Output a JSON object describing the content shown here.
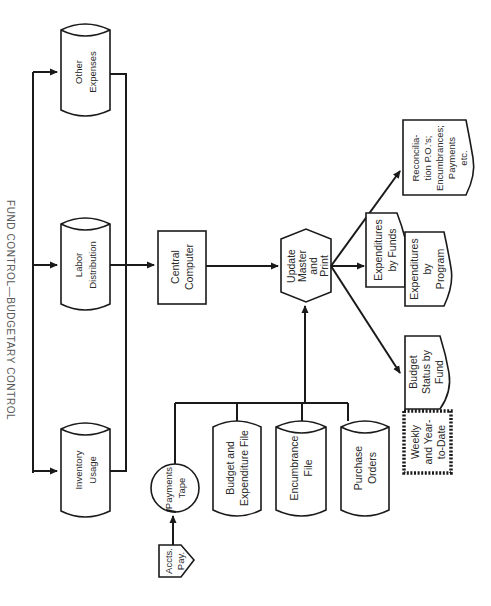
{
  "title": "FUND CONTROL—BUDGETARY CONTROL",
  "orientation": "rotated 90 degrees clockwise",
  "nodes": {
    "other_expenses": {
      "type": "disk-file",
      "lines": [
        "Other",
        "Expenses"
      ]
    },
    "labor_distribution": {
      "type": "disk-file",
      "lines": [
        "Labor",
        "Distribution"
      ]
    },
    "inventory_usage": {
      "type": "disk-file",
      "lines": [
        "Inventory",
        "Usage"
      ]
    },
    "central_computer": {
      "type": "process",
      "lines": [
        "Central",
        "Computer"
      ]
    },
    "update_master": {
      "type": "preparation-hexagon",
      "lines": [
        "Update",
        "Master",
        "and",
        "Print"
      ]
    },
    "payments_tape": {
      "type": "tape",
      "lines": [
        "Payments",
        "Tape"
      ]
    },
    "accts_pay": {
      "type": "off-page-connector",
      "lines": [
        "Accts.",
        "Pay."
      ]
    },
    "budget_expenditure_file": {
      "type": "disk-file",
      "lines": [
        "Budget and",
        "Expenditure File"
      ]
    },
    "encumbrance_file": {
      "type": "disk-file",
      "lines": [
        "Encumbrance",
        "File"
      ]
    },
    "purchase_orders": {
      "type": "disk-file",
      "lines": [
        "Purchase",
        "Orders"
      ]
    },
    "reconciliation": {
      "type": "document",
      "lines": [
        "Reconcilia-",
        "tion P.O.'s;",
        "Encumbrances;",
        "Payments",
        "etc."
      ]
    },
    "expenditures_by_funds": {
      "type": "document",
      "lines": [
        "Expenditures",
        "by Funds"
      ]
    },
    "expenditures_by_program": {
      "type": "document",
      "lines": [
        "Expenditures",
        "by",
        "Program"
      ]
    },
    "budget_status": {
      "type": "document",
      "lines": [
        "Budget",
        "Status by",
        "Fund"
      ]
    },
    "weekly_ytd": {
      "type": "annotation",
      "lines": [
        "Weekly",
        "and Year-",
        "to-Date"
      ]
    }
  },
  "edges": [
    [
      "labor_distribution",
      "central_computer"
    ],
    [
      "central_computer",
      "update_master"
    ],
    [
      "accts_pay",
      "payments_tape"
    ],
    [
      "payments_tape",
      "update_master"
    ],
    [
      "budget_expenditure_file",
      "update_master"
    ],
    [
      "encumbrance_file",
      "update_master"
    ],
    [
      "purchase_orders",
      "update_master"
    ],
    [
      "update_master",
      "reconciliation"
    ],
    [
      "update_master",
      "expenditures_by_funds"
    ],
    [
      "update_master",
      "budget_status"
    ],
    [
      "bus",
      "other_expenses"
    ],
    [
      "bus",
      "labor_distribution"
    ],
    [
      "bus",
      "inventory_usage"
    ]
  ]
}
